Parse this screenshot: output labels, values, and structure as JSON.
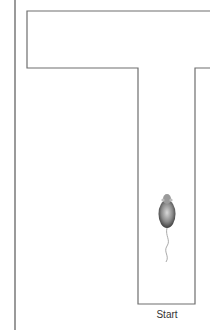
{
  "diagram": {
    "type": "t-maze",
    "labels": {
      "start": "Start"
    },
    "colors": {
      "outline": "#6e6e6e",
      "left_rule": "#9a9a9a",
      "background": "#ffffff"
    }
  }
}
